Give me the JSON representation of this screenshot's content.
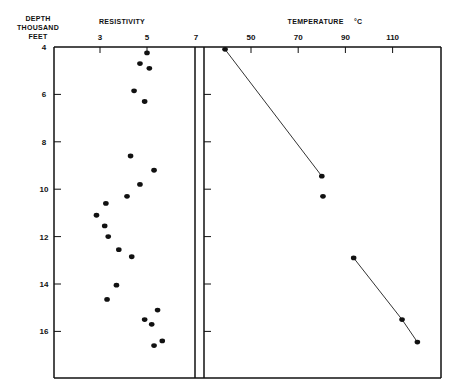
{
  "labels": {
    "depth_axis": "DEPTH\nTHOUSAND FEET",
    "depth_line1": "DEPTH",
    "depth_line2": "THOUSAND FEET",
    "resistivity_title": "RESISTIVITY",
    "temperature_title": "TEMPERATURE",
    "temperature_unit": "°C"
  },
  "chart_data": [
    {
      "type": "scatter",
      "title": "RESISTIVITY",
      "xlabel": "Resistivity",
      "ylabel": "DEPTH THOUSAND FEET",
      "x_ticks": [
        3,
        5,
        7
      ],
      "y_ticks": [
        4,
        6,
        8,
        10,
        12,
        14,
        16
      ],
      "xlim": [
        1.7,
        7.0
      ],
      "ylim": [
        17.7,
        4
      ],
      "y_inverted": true,
      "grid": false,
      "points": [
        {
          "resistivity": 5.0,
          "depth": 4.25
        },
        {
          "resistivity": 4.7,
          "depth": 4.7
        },
        {
          "resistivity": 5.1,
          "depth": 4.9
        },
        {
          "resistivity": 4.45,
          "depth": 5.85
        },
        {
          "resistivity": 4.9,
          "depth": 6.3
        },
        {
          "resistivity": 4.3,
          "depth": 8.6
        },
        {
          "resistivity": 5.3,
          "depth": 9.2
        },
        {
          "resistivity": 4.7,
          "depth": 9.8
        },
        {
          "resistivity": 4.15,
          "depth": 10.3
        },
        {
          "resistivity": 3.25,
          "depth": 10.6
        },
        {
          "resistivity": 2.85,
          "depth": 11.1
        },
        {
          "resistivity": 3.2,
          "depth": 11.55
        },
        {
          "resistivity": 3.35,
          "depth": 12.0
        },
        {
          "resistivity": 3.8,
          "depth": 12.55
        },
        {
          "resistivity": 4.35,
          "depth": 12.85
        },
        {
          "resistivity": 3.7,
          "depth": 14.05
        },
        {
          "resistivity": 3.3,
          "depth": 14.65
        },
        {
          "resistivity": 5.45,
          "depth": 15.1
        },
        {
          "resistivity": 4.9,
          "depth": 15.5
        },
        {
          "resistivity": 5.2,
          "depth": 15.7
        },
        {
          "resistivity": 5.65,
          "depth": 16.4
        },
        {
          "resistivity": 5.3,
          "depth": 16.6
        }
      ]
    },
    {
      "type": "line",
      "title": "TEMPERATURE °C",
      "xlabel": "Temperature (°C)",
      "ylabel": "DEPTH THOUSAND FEET",
      "x_ticks": [
        50,
        70,
        90,
        110
      ],
      "xlim": [
        38,
        123
      ],
      "ylim": [
        17.7,
        4
      ],
      "y_inverted": true,
      "grid": false,
      "series": [
        {
          "name": "segment-1",
          "points": [
            {
              "temperature": 39,
              "depth": 4.1
            },
            {
              "temperature": 80,
              "depth": 9.45
            }
          ]
        },
        {
          "name": "isolated",
          "points": [
            {
              "temperature": 80.5,
              "depth": 10.3
            }
          ]
        },
        {
          "name": "segment-2",
          "points": [
            {
              "temperature": 93.5,
              "depth": 12.9
            },
            {
              "temperature": 114,
              "depth": 15.5
            },
            {
              "temperature": 120.5,
              "depth": 16.45
            }
          ]
        }
      ]
    }
  ]
}
